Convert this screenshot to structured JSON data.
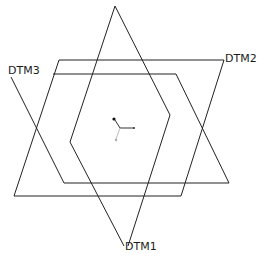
{
  "diagram": {
    "type": "datum-planes",
    "stroke_color": "#222222",
    "planes": [
      {
        "name": "DTM1",
        "label": "DTM1",
        "points": "115,6 170,115 128,246 70,142"
      },
      {
        "name": "DTM2",
        "label": "DTM2",
        "points": "59,60 224,60 181,196 14,196"
      },
      {
        "name": "DTM3",
        "label": "DTM3",
        "points": "53,74 176,74 229,183 64,183 11,77"
      }
    ],
    "labels": {
      "dtm1": "DTM1",
      "dtm2": "DTM2",
      "dtm3": "DTM3"
    },
    "csys_icon": "coordinate-system-icon"
  }
}
